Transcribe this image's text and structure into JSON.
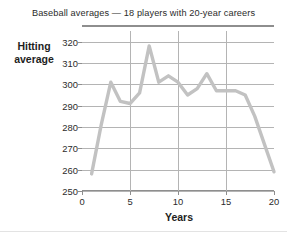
{
  "chart_data": {
    "type": "line",
    "title": "Baseball averages — 18 players with 20-year careers",
    "xlabel": "Years",
    "ylabel": "Hitting average",
    "ylabel_lines": [
      "Hitting",
      "average"
    ],
    "xlim": [
      0,
      20
    ],
    "ylim": [
      250,
      325
    ],
    "grid": true,
    "legend": "none",
    "line_color": "#c2c2c2",
    "grid_color": "#b4b4b4",
    "axis_color": "#8e8e8e",
    "text_color": "#2b2b2b",
    "ytick_labels": [
      "250",
      "260",
      "270",
      "280",
      "290",
      "300",
      "310",
      "320"
    ],
    "ytick_values": [
      250,
      260,
      270,
      280,
      290,
      300,
      310,
      320
    ],
    "xtick_labels": [
      "0",
      "5",
      "10",
      "15",
      "20"
    ],
    "xtick_values": [
      0,
      5,
      10,
      15,
      20
    ],
    "x": [
      1,
      2,
      3,
      4,
      5,
      6,
      7,
      8,
      9,
      10,
      11,
      12,
      13,
      14,
      15,
      16,
      17,
      18,
      19,
      20
    ],
    "values": [
      258,
      281,
      301,
      292,
      291,
      296,
      318,
      301,
      304,
      301,
      295,
      298,
      305,
      297,
      297,
      297,
      295,
      285,
      272,
      259
    ],
    "series": [
      {
        "name": "Hitting average",
        "values": [
          258,
          281,
          301,
          292,
          291,
          296,
          318,
          301,
          304,
          301,
          295,
          298,
          305,
          297,
          297,
          297,
          295,
          285,
          272,
          259
        ]
      }
    ]
  }
}
